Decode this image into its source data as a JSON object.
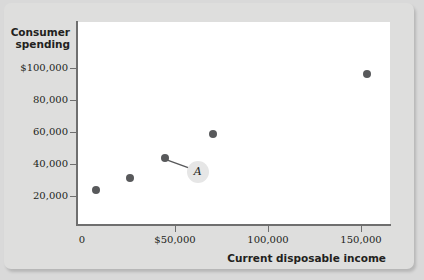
{
  "chart_data": {
    "type": "scatter",
    "title": "",
    "xlabel": "Current disposable income",
    "ylabel": "Consumer spending",
    "ylabel_line1": "Consumer",
    "ylabel_line2": "spending",
    "xlim": [
      0,
      160000
    ],
    "ylim": [
      0,
      112000
    ],
    "grid": false,
    "legend": null,
    "x_ticks": [
      {
        "value": 0,
        "label": "0"
      },
      {
        "value": 50000,
        "label": "$50,000"
      },
      {
        "value": 100000,
        "label": "100,000"
      },
      {
        "value": 150000,
        "label": "150,000"
      }
    ],
    "y_ticks": [
      {
        "value": 20000,
        "label": "20,000"
      },
      {
        "value": 40000,
        "label": "40,000"
      },
      {
        "value": 60000,
        "label": "60,000"
      },
      {
        "value": 80000,
        "label": "80,000"
      },
      {
        "value": 100000,
        "label": "$100,000"
      }
    ],
    "points": [
      {
        "x": 7500,
        "y": 23800,
        "label": ""
      },
      {
        "x": 26000,
        "y": 31300,
        "label": ""
      },
      {
        "x": 44500,
        "y": 43800,
        "label": "A"
      },
      {
        "x": 70500,
        "y": 58800,
        "label": ""
      },
      {
        "x": 153000,
        "y": 96300,
        "label": ""
      }
    ],
    "annotations": [
      {
        "text": "A",
        "target_point_index": 2,
        "note": "label with leader line pointing to third data point"
      }
    ],
    "colors": {
      "dot": "#58595b",
      "axis": "#6f6f6f",
      "plot_background": "#ffffff",
      "panel_background": "#dededd",
      "page_background": "#d9d9d9",
      "text": "#231f20",
      "label_halo": "#e6e6e6"
    }
  }
}
